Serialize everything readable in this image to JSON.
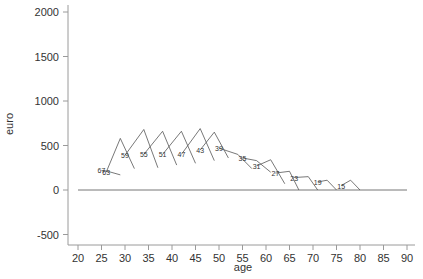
{
  "chart_data": {
    "type": "line",
    "title": "",
    "xlabel": "age",
    "ylabel": "euro",
    "xlim": [
      20,
      90
    ],
    "ylim": [
      -600,
      2050
    ],
    "xticks": [
      20,
      25,
      30,
      35,
      40,
      45,
      50,
      55,
      60,
      65,
      70,
      75,
      80,
      85,
      90
    ],
    "yticks": [
      -500,
      0,
      500,
      1000,
      1500,
      2000
    ],
    "zero_line": {
      "from": 20,
      "to": 90,
      "value": 0
    },
    "series": [
      {
        "name": "67",
        "label": "67",
        "points": [
          [
            25,
            220
          ],
          [
            27,
            200
          ],
          [
            29,
            170
          ]
        ]
      },
      {
        "name": "63",
        "label": "63",
        "points": [
          [
            26,
            200
          ],
          [
            29,
            580
          ],
          [
            32,
            240
          ]
        ]
      },
      {
        "name": "59",
        "label": "59",
        "points": [
          [
            30,
            390
          ],
          [
            34,
            680
          ],
          [
            37,
            250
          ]
        ]
      },
      {
        "name": "55",
        "label": "55",
        "points": [
          [
            34,
            400
          ],
          [
            38,
            660
          ],
          [
            41,
            280
          ]
        ]
      },
      {
        "name": "51",
        "label": "51",
        "points": [
          [
            38,
            400
          ],
          [
            42,
            660
          ],
          [
            45,
            300
          ]
        ]
      },
      {
        "name": "47",
        "label": "47",
        "points": [
          [
            42,
            400
          ],
          [
            46,
            690
          ],
          [
            49,
            330
          ]
        ]
      },
      {
        "name": "43",
        "label": "43",
        "points": [
          [
            46,
            450
          ],
          [
            49,
            650
          ],
          [
            52,
            360
          ]
        ]
      },
      {
        "name": "39",
        "label": "39",
        "points": [
          [
            50,
            470
          ],
          [
            54,
            400
          ],
          [
            57,
            240
          ]
        ]
      },
      {
        "name": "35",
        "label": "35",
        "points": [
          [
            55,
            360
          ],
          [
            58,
            330
          ],
          [
            61,
            200
          ]
        ]
      },
      {
        "name": "31",
        "label": "31",
        "points": [
          [
            58,
            270
          ],
          [
            61,
            340
          ],
          [
            64,
            70
          ]
        ]
      },
      {
        "name": "27",
        "label": "27",
        "points": [
          [
            62,
            190
          ],
          [
            65,
            210
          ],
          [
            67,
            0
          ]
        ]
      },
      {
        "name": "23",
        "label": "23",
        "points": [
          [
            66,
            140
          ],
          [
            69,
            150
          ],
          [
            71,
            0
          ]
        ]
      },
      {
        "name": "19",
        "label": "19",
        "points": [
          [
            71,
            90
          ],
          [
            73,
            110
          ],
          [
            75,
            0
          ]
        ]
      },
      {
        "name": "15",
        "label": "15",
        "points": [
          [
            76,
            50
          ],
          [
            78,
            110
          ],
          [
            80,
            0
          ]
        ]
      }
    ]
  }
}
